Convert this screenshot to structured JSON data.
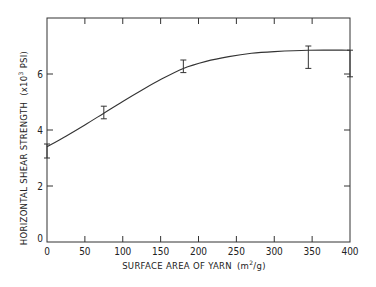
{
  "chart_data": {
    "type": "line",
    "title": "",
    "xlabel": "SURFACE AREA OF YARN (m²/g)",
    "xlabel_main": "SURFACE AREA OF YARN",
    "xlabel_unit_open": "(m",
    "xlabel_unit_sup": "2",
    "xlabel_unit_close": "/g)",
    "ylabel": "HORIZONTAL SHEAR STRENGTH (x10³ PSI)",
    "ylabel_main": "HORIZONTAL SHEAR STRENGTH",
    "ylabel_unit_open": "(x10",
    "ylabel_unit_sup": "3",
    "ylabel_unit_close": " PSI)",
    "xlim": [
      0,
      400
    ],
    "ylim": [
      0,
      8
    ],
    "x_ticks": [
      0,
      50,
      100,
      150,
      200,
      250,
      300,
      350,
      400
    ],
    "y_ticks": [
      0,
      2,
      4,
      6
    ],
    "grid": false,
    "legend": null,
    "series": [
      {
        "name": "Horizontal shear strength",
        "points": [
          {
            "x": 0,
            "y": 3.4,
            "err_low": 3.0,
            "err_high": 3.5
          },
          {
            "x": 75,
            "y": 4.6,
            "err_low": 4.4,
            "err_high": 4.85
          },
          {
            "x": 180,
            "y": 6.2,
            "err_low": 6.05,
            "err_high": 6.5
          },
          {
            "x": 345,
            "y": 6.85,
            "err_low": 6.2,
            "err_high": 7.0
          },
          {
            "x": 400,
            "y": 6.85,
            "err_low": 5.9,
            "err_high": 6.85
          }
        ],
        "curve": [
          [
            0,
            3.4
          ],
          [
            25,
            3.78
          ],
          [
            50,
            4.18
          ],
          [
            75,
            4.6
          ],
          [
            100,
            5.02
          ],
          [
            125,
            5.42
          ],
          [
            150,
            5.8
          ],
          [
            180,
            6.2
          ],
          [
            210,
            6.45
          ],
          [
            240,
            6.62
          ],
          [
            270,
            6.74
          ],
          [
            300,
            6.8
          ],
          [
            345,
            6.85
          ],
          [
            400,
            6.85
          ]
        ]
      }
    ]
  }
}
